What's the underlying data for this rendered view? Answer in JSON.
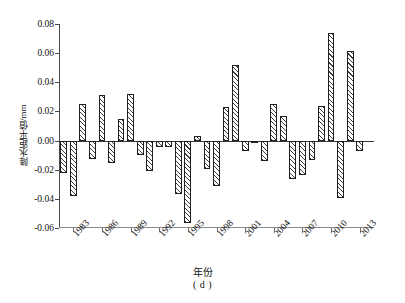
{
  "chart_data": {
    "type": "bar",
    "title": "",
    "subtitle": "",
    "caption": "( d )",
    "xlabel": "年份",
    "ylabel": "降水距平值/mm",
    "ylim": [
      -0.06,
      0.08
    ],
    "ytick_labels": [
      "0.08",
      "0.06",
      "0.04",
      "0.02",
      "0.00",
      "-0.02",
      "-0.04",
      "-0.06"
    ],
    "ytick_values": [
      0.08,
      0.06,
      0.04,
      0.02,
      0.0,
      -0.02,
      -0.04,
      -0.06
    ],
    "xtick_labels": [
      "1983",
      "1986",
      "1989",
      "1992",
      "1995",
      "1998",
      "2001",
      "2004",
      "2007",
      "2010",
      "2013"
    ],
    "xtick_values": [
      1983,
      1986,
      1989,
      1992,
      1995,
      1998,
      2001,
      2004,
      2007,
      2010,
      2013
    ],
    "xlim": [
      1981.5,
      2014.5
    ],
    "grid": false,
    "legend": "none",
    "bar_style": {
      "fill": "#ffffff",
      "hatch": "///",
      "hatch_color": "#3c3c3c",
      "edge_color": "#1f1f1f"
    },
    "categories": [
      1982,
      1983,
      1984,
      1985,
      1986,
      1987,
      1988,
      1989,
      1990,
      1991,
      1992,
      1993,
      1994,
      1995,
      1996,
      1997,
      1998,
      1999,
      2000,
      2001,
      2002,
      2003,
      2004,
      2005,
      2006,
      2007,
      2008,
      2009,
      2010,
      2011,
      2012,
      2013,
      2014
    ],
    "values": [
      -0.0225,
      -0.0378,
      0.0248,
      -0.0124,
      0.031,
      -0.0155,
      0.015,
      0.0323,
      -0.0101,
      -0.0211,
      -0.0047,
      -0.0046,
      -0.037,
      -0.0565,
      0.003,
      -0.0192,
      -0.031,
      0.0228,
      0.0516,
      -0.0074,
      -0.0013,
      -0.014,
      0.025,
      0.0166,
      -0.0262,
      -0.0239,
      -0.0134,
      0.0236,
      0.0735,
      -0.0394,
      0.0617,
      -0.0072,
      0.0
    ],
    "series_name": "降水距平值"
  }
}
